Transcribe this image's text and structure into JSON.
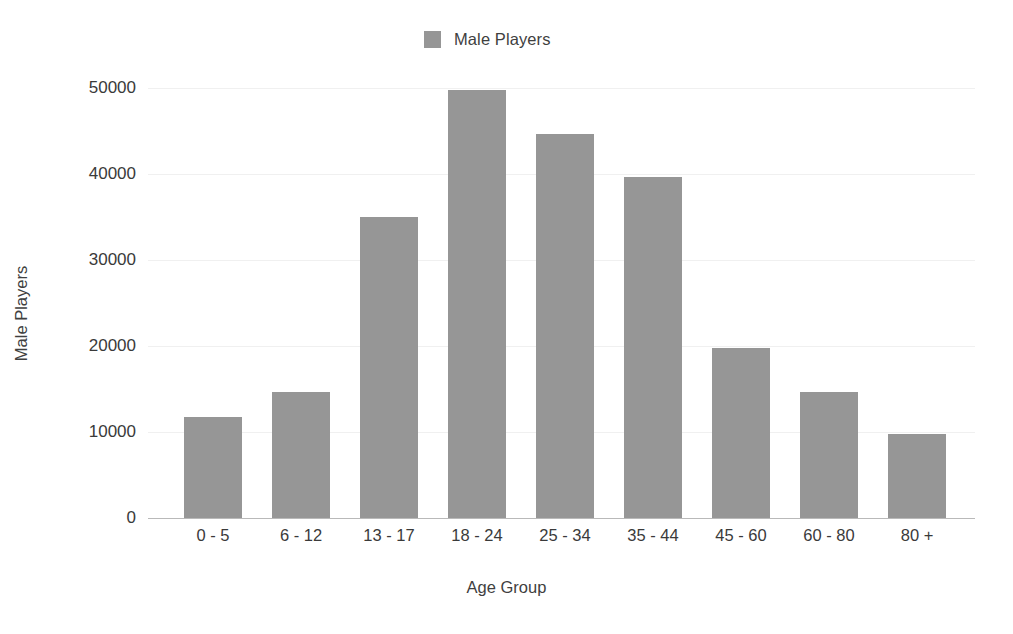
{
  "chart_data": {
    "type": "bar",
    "title": "",
    "subtitle": "",
    "xlabel": "Age Group",
    "ylabel": "Male Players",
    "categories": [
      "0 - 5",
      "6 - 12",
      "13 - 17",
      "18 - 24",
      "25 - 34",
      "35 - 44",
      "45 - 60",
      "60 - 80",
      "80 +"
    ],
    "series": [
      {
        "name": "Male Players",
        "color": "#969696",
        "values": [
          11800,
          14700,
          35000,
          49800,
          44600,
          39700,
          19800,
          14600,
          9800
        ]
      }
    ],
    "ylim": [
      0,
      50000
    ],
    "yticks": [
      0,
      10000,
      20000,
      30000,
      40000,
      50000
    ],
    "ytick_labels": [
      "0",
      "10000",
      "20000",
      "30000",
      "40000",
      "50000"
    ],
    "grid": "horizontal-faint",
    "legend": {
      "position": "top-center",
      "entries": [
        {
          "label": "Male Players",
          "color": "#969696"
        }
      ]
    }
  },
  "colors": {
    "bar": "#969696",
    "background": "#ffffff",
    "axis": "#b9b9b9",
    "grid": "#f0f0f0",
    "text": "#3a3a3a"
  }
}
